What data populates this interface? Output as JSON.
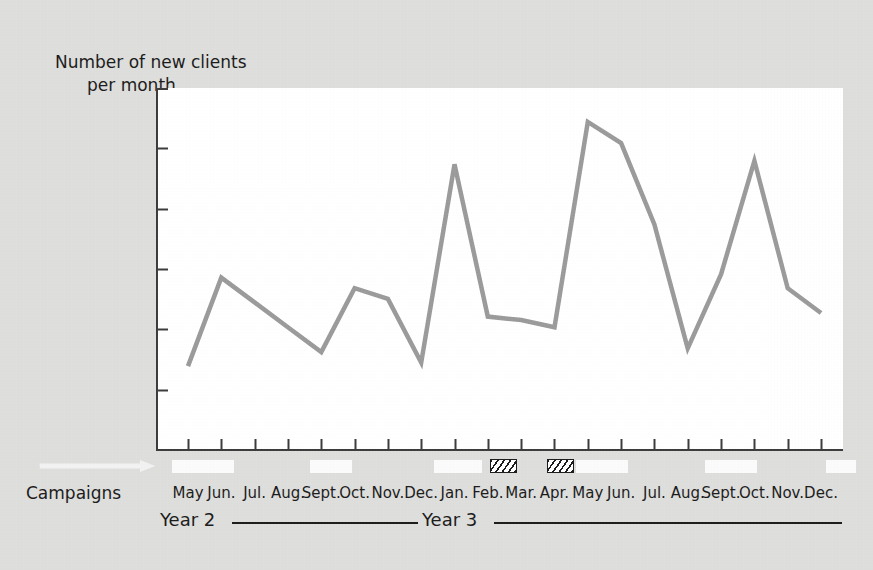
{
  "figure": {
    "y_axis_title_line1": "Number of new clients",
    "y_axis_title_line2": "per month",
    "campaigns_label": "Campaigns",
    "background_color": "#dededc",
    "plot_background_color": "#ffffff",
    "line_color": "#9a9a9a",
    "axis_color": "#3a3a3a"
  },
  "year_axis": {
    "segments": [
      {
        "label": "Year 2",
        "left": 160,
        "rule_left": 232,
        "rule_width": 170
      },
      {
        "label": "Year 3",
        "label_left": 420,
        "rule_left_before": 406,
        "rule_width_before": 12,
        "rule_left": 492,
        "rule_width": 350
      }
    ],
    "year2_label": "Year 2",
    "year3_label": "Year 3"
  },
  "campaign_markers": [
    {
      "type": "arrow",
      "name": "campaign-arrow-ongoing",
      "left": 30,
      "width": 135,
      "fill": "#f2f2f2"
    },
    {
      "type": "box",
      "name": "campaign-box-1",
      "left": 172,
      "width": 62,
      "fill": "#fbfbfb"
    },
    {
      "type": "box",
      "name": "campaign-box-2",
      "left": 310,
      "width": 42,
      "fill": "#fbfbfb"
    },
    {
      "type": "box",
      "name": "campaign-box-3",
      "left": 434,
      "width": 48,
      "fill": "#fbfbfb"
    },
    {
      "type": "hatch",
      "name": "campaign-hatch-1",
      "left": 490,
      "width": 27
    },
    {
      "type": "hatch",
      "name": "campaign-hatch-2",
      "left": 547,
      "width": 27
    },
    {
      "type": "box",
      "name": "campaign-box-4",
      "left": 576,
      "width": 52,
      "fill": "#fbfbfb"
    },
    {
      "type": "box",
      "name": "campaign-box-5",
      "left": 705,
      "width": 52,
      "fill": "#fbfbfb"
    },
    {
      "type": "box",
      "name": "campaign-box-6",
      "left": 826,
      "width": 30,
      "fill": "#fbfbfb"
    }
  ],
  "chart_data": {
    "type": "line",
    "title": "",
    "xlabel": "",
    "ylabel": "Number of new clients per month",
    "grid": false,
    "legend": "none",
    "x_tick_count": 20,
    "y_tick_count": 5,
    "y_axis_labeled": false,
    "ylim": [
      0,
      100
    ],
    "categories": [
      "May",
      "Jun.",
      "Jul.",
      "Aug.",
      "Sept.",
      "Oct.",
      "Nov.",
      "Dec.",
      "Jan.",
      "Feb.",
      "Mar.",
      "Apr.",
      "May",
      "Jun.",
      "Jul.",
      "Aug.",
      "Sept.",
      "Oct.",
      "Nov.",
      "Dec."
    ],
    "category_years": [
      "Year 2",
      "Year 2",
      "Year 2",
      "Year 2",
      "Year 2",
      "Year 2",
      "Year 2",
      "Year 2",
      "Year 3",
      "Year 3",
      "Year 3",
      "Year 3",
      "Year 3",
      "Year 3",
      "Year 3",
      "Year 3",
      "Year 3",
      "Year 3",
      "Year 3",
      "Year 3"
    ],
    "series": [
      {
        "name": "New clients per month",
        "color": "#9a9a9a",
        "values": [
          22,
          47,
          40,
          33,
          26,
          44,
          41,
          23,
          79,
          36,
          35,
          33,
          91,
          85,
          62,
          27,
          48,
          80,
          44,
          37
        ]
      }
    ]
  }
}
